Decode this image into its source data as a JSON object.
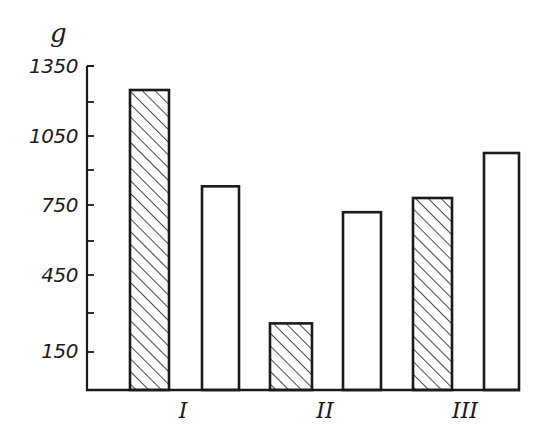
{
  "chart_data": {
    "type": "bar",
    "title": "",
    "xlabel": "",
    "ylabel": "g",
    "ylim": [
      0,
      1350
    ],
    "yticks": [
      150,
      300,
      450,
      600,
      750,
      900,
      1050,
      1200,
      1350
    ],
    "ytick_labels": [
      "150",
      "",
      "450",
      "",
      "750",
      "",
      "1050",
      "",
      "1350"
    ],
    "categories": [
      "I",
      "II",
      "III"
    ],
    "series": [
      {
        "name": "hatched",
        "pattern": "diagonal-hatch",
        "values": [
          1250,
          260,
          780
        ]
      },
      {
        "name": "open",
        "pattern": "none",
        "values": [
          830,
          720,
          975
        ]
      }
    ],
    "grid": false,
    "legend": null
  },
  "axis": {
    "unit_label": "g",
    "tick_labels": [
      "1350",
      "1050",
      "750",
      "450",
      "150"
    ]
  },
  "colors": {
    "ink": "#1a1a1a",
    "background": "#ffffff"
  }
}
